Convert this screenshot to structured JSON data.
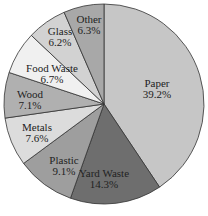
{
  "chart_data": {
    "type": "pie",
    "title": "",
    "start_angle_deg": 0,
    "direction": "clockwise",
    "slices": [
      {
        "label": "Paper",
        "value": 39.2,
        "display": "39.2%",
        "color": "#c6c6c6"
      },
      {
        "label": "Yard Waste",
        "value": 14.3,
        "display": "14.3%",
        "color": "#6e6e6e"
      },
      {
        "label": "Plastic",
        "value": 9.1,
        "display": "9.1%",
        "color": "#9e9e9e"
      },
      {
        "label": "Metals",
        "value": 7.6,
        "display": "7.6%",
        "color": "#dcdcdc"
      },
      {
        "label": "Wood",
        "value": 7.1,
        "display": "7.1%",
        "color": "#b0b0b0"
      },
      {
        "label": "Food Waste",
        "value": 6.7,
        "display": "6.7%",
        "color": "#f0f0f0"
      },
      {
        "label": "Glass",
        "value": 6.2,
        "display": "6.2%",
        "color": "#d2d2d2"
      },
      {
        "label": "Other",
        "value": 6.3,
        "display": "6.3%",
        "color": "#a8a8a8"
      }
    ],
    "legend": "none (labels inside slices)"
  }
}
